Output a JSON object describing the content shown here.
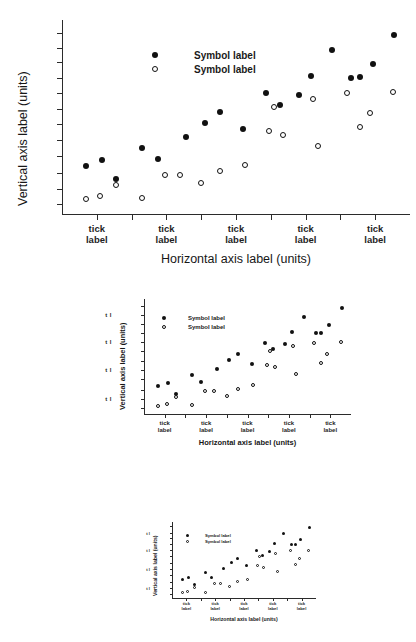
{
  "page": {
    "background": "#ffffff",
    "ink": "#1a1a1a",
    "description": "Same scatter plot reproduced at three progressively smaller sizes"
  },
  "chart_data": {
    "type": "scatter",
    "title": "",
    "xlabel": "Horizontal axis label (units)",
    "ylabel": "Vertical axis label (units)",
    "xlim": [
      0,
      100
    ],
    "ylim": [
      0,
      100
    ],
    "grid": false,
    "legend_position": "upper-left-inside",
    "x_tick_labels": [
      "tick label",
      "tick label",
      "tick label",
      "tick label",
      "tick label"
    ],
    "x_major_tick_positions": [
      10,
      30,
      50,
      70,
      90
    ],
    "x_minor_tick_positions": [
      20,
      40,
      60,
      80
    ],
    "y_tick_labels": [
      "t l",
      "t l",
      "t l",
      "t l"
    ],
    "y_major_tick_positions": [
      13,
      38,
      62,
      85
    ],
    "y_minor_tick_positions": [
      5,
      21,
      30,
      46,
      54,
      70,
      78,
      93
    ],
    "series": [
      {
        "name": "Symbol label",
        "marker": "filled-circle",
        "color": "#111111",
        "points": [
          {
            "x": 7.0,
            "y": 25.0
          },
          {
            "x": 11.5,
            "y": 28.0
          },
          {
            "x": 15.5,
            "y": 18.5
          },
          {
            "x": 23.0,
            "y": 34.5
          },
          {
            "x": 27.5,
            "y": 28.5
          },
          {
            "x": 35.5,
            "y": 40.0
          },
          {
            "x": 41.0,
            "y": 47.0
          },
          {
            "x": 45.5,
            "y": 53.0
          },
          {
            "x": 52.0,
            "y": 44.0
          },
          {
            "x": 58.5,
            "y": 62.5
          },
          {
            "x": 62.5,
            "y": 56.5
          },
          {
            "x": 68.0,
            "y": 61.5
          },
          {
            "x": 71.5,
            "y": 71.5
          },
          {
            "x": 77.5,
            "y": 84.5
          },
          {
            "x": 83.0,
            "y": 70.5
          },
          {
            "x": 85.5,
            "y": 71.0
          },
          {
            "x": 89.5,
            "y": 77.5
          },
          {
            "x": 95.5,
            "y": 92.5
          }
        ]
      },
      {
        "name": "Symbol label",
        "marker": "open-circle",
        "color": "#111111",
        "points": [
          {
            "x": 7.0,
            "y": 8.0
          },
          {
            "x": 11.0,
            "y": 9.5
          },
          {
            "x": 15.5,
            "y": 15.5
          },
          {
            "x": 23.0,
            "y": 8.5
          },
          {
            "x": 29.5,
            "y": 20.5
          },
          {
            "x": 34.0,
            "y": 20.5
          },
          {
            "x": 40.0,
            "y": 16.5
          },
          {
            "x": 45.5,
            "y": 22.5
          },
          {
            "x": 52.5,
            "y": 25.5
          },
          {
            "x": 59.5,
            "y": 43.0
          },
          {
            "x": 61.0,
            "y": 55.5
          },
          {
            "x": 63.5,
            "y": 41.0
          },
          {
            "x": 72.0,
            "y": 59.5
          },
          {
            "x": 73.5,
            "y": 35.5
          },
          {
            "x": 82.0,
            "y": 62.5
          },
          {
            "x": 85.5,
            "y": 45.0
          },
          {
            "x": 88.5,
            "y": 52.5
          },
          {
            "x": 95.0,
            "y": 63.0
          }
        ]
      }
    ]
  },
  "figures": [
    {
      "id": "fig1",
      "scale_label": "100%"
    },
    {
      "id": "fig2",
      "scale_label": "62%"
    },
    {
      "id": "fig3",
      "scale_label": "42%"
    }
  ]
}
